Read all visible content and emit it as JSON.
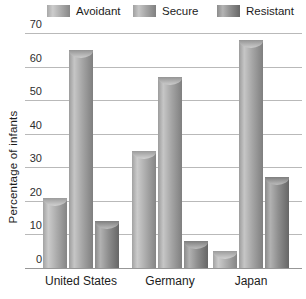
{
  "legend": {
    "items": [
      {
        "label": "Avoidant",
        "series": "avoidant"
      },
      {
        "label": "Secure",
        "series": "secure"
      },
      {
        "label": "Resistant",
        "series": "resistant"
      }
    ]
  },
  "chart_data": {
    "type": "bar",
    "title": "",
    "xlabel": "",
    "ylabel": "Percentage of infants",
    "categories": [
      "United States",
      "Germany",
      "Japan"
    ],
    "series": [
      {
        "name": "Avoidant",
        "values": [
          21,
          35,
          5
        ]
      },
      {
        "name": "Secure",
        "values": [
          65,
          57,
          68
        ]
      },
      {
        "name": "Resistant",
        "values": [
          14,
          8,
          27
        ]
      }
    ],
    "yticks": [
      0,
      10,
      20,
      30,
      40,
      50,
      60,
      70
    ],
    "ylim": [
      0,
      70
    ],
    "grid": true,
    "legend_position": "top",
    "bar_style": "3d-cylinder"
  },
  "colors": {
    "avoidant": "#adadad",
    "secure": "#a6a6a6",
    "resistant": "#8f8f8f",
    "gridline": "#b9b9b9",
    "axis": "#979797",
    "text": "#1c1c1c",
    "background": "#ffffff"
  }
}
